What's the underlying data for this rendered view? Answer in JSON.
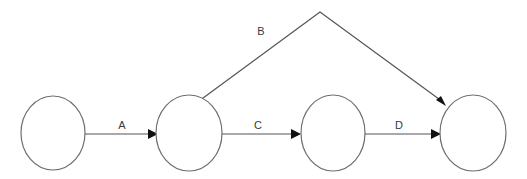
{
  "diagram": {
    "type": "directed-graph",
    "canvas": {
      "width": 527,
      "height": 179,
      "background": "#ffffff"
    },
    "style": {
      "node_stroke": "#6e6e6e",
      "node_fill": "#ffffff",
      "edge_stroke": "#555555",
      "arrowhead_fill": "#111111",
      "label_color": "#3a3a3a"
    },
    "nodes": [
      {
        "id": "n1",
        "label": "",
        "cx": 53,
        "cy": 133,
        "rx": 32,
        "ry": 37
      },
      {
        "id": "n2",
        "label": "",
        "cx": 189,
        "cy": 133,
        "rx": 33,
        "ry": 38
      },
      {
        "id": "n3",
        "label": "",
        "cx": 333,
        "cy": 133,
        "rx": 32,
        "ry": 38
      },
      {
        "id": "n4",
        "label": "",
        "cx": 473,
        "cy": 133,
        "rx": 33,
        "ry": 38
      }
    ],
    "edges": [
      {
        "id": "e-a",
        "label": "A",
        "from": "n1",
        "to": "n2",
        "shape": "straight",
        "label_x": 122,
        "label_y": 126
      },
      {
        "id": "e-b",
        "label": "B",
        "from": "n2",
        "to": "n4",
        "shape": "polyline-apex",
        "label_x": 261,
        "label_y": 32
      },
      {
        "id": "e-c",
        "label": "C",
        "from": "n2",
        "to": "n3",
        "shape": "straight",
        "label_x": 258,
        "label_y": 126
      },
      {
        "id": "e-d",
        "label": "D",
        "from": "n3",
        "to": "n4",
        "shape": "straight",
        "label_x": 399,
        "label_y": 126
      }
    ]
  }
}
